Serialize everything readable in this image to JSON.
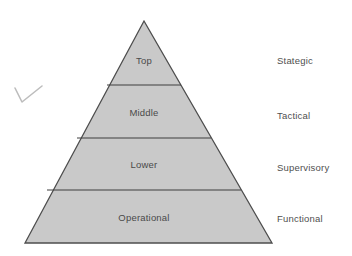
{
  "diagram": {
    "type": "pyramid",
    "title": "",
    "fill_color": "#c9c9c9",
    "stroke_color": "#4d4d4d",
    "text_color": "#4a4a4a",
    "background_color": "#ffffff",
    "apex": {
      "x": 144,
      "y": 21
    },
    "base_left": {
      "x": 25,
      "y": 243
    },
    "base_right": {
      "x": 272,
      "y": 243
    },
    "divider_y": [
      85,
      138,
      190
    ],
    "tiers": [
      {
        "label": "Top",
        "side_label": "Stategic",
        "label_center_x": 144,
        "label_center_y": 60,
        "side_label_x": 277,
        "side_label_y": 56
      },
      {
        "label": "Middle",
        "side_label": "Tactical",
        "label_center_x": 144,
        "label_center_y": 112,
        "side_label_x": 277,
        "side_label_y": 111
      },
      {
        "label": "Lower",
        "side_label": "Supervisory",
        "label_center_x": 144,
        "label_center_y": 164,
        "side_label_x": 277,
        "side_label_y": 163
      },
      {
        "label": "Operational",
        "side_label": "Functional",
        "label_center_x": 144,
        "label_center_y": 217,
        "side_label_x": 277,
        "side_label_y": 214
      }
    ],
    "annotation": {
      "name": "check-mark",
      "color": "#b9b9b9"
    }
  }
}
